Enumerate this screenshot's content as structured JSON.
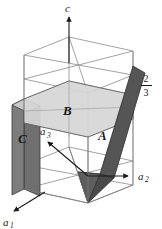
{
  "figure": {
    "background_color": "#ffffff",
    "line_color": "#6b6b6b",
    "line_color_dark": "#3c3c3c",
    "axes": [
      {
        "id": "c",
        "label": "c",
        "subscript": "",
        "direction": "up"
      },
      {
        "id": "a1",
        "label": "a",
        "subscript": "1",
        "direction": "down-left"
      },
      {
        "id": "a2",
        "label": "a",
        "subscript": "2",
        "direction": "right"
      },
      {
        "id": "a3",
        "label": "a",
        "subscript": "3",
        "direction": "up-left"
      }
    ],
    "planes": [
      {
        "id": "A",
        "label": "A",
        "fill": "#555555",
        "orientation": "slanted-right"
      },
      {
        "id": "B",
        "label": "B",
        "fill": "#d6d6d6",
        "orientation": "horizontal"
      },
      {
        "id": "C",
        "label": "C",
        "fill": "#6f6f6f",
        "orientation": "vertical-left"
      }
    ],
    "annotations": [
      {
        "id": "height-fraction",
        "numerator": "2",
        "denominator": "3",
        "text": "2/3"
      }
    ]
  }
}
